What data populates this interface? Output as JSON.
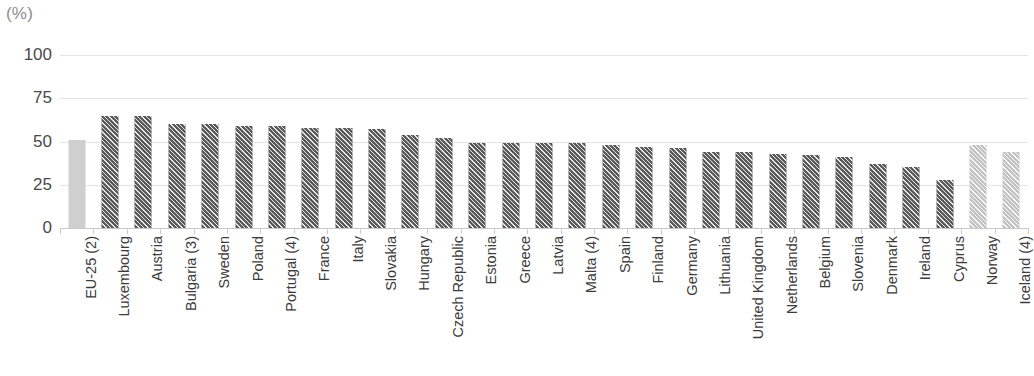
{
  "chart_data": {
    "type": "bar",
    "title": "",
    "subtitle": "",
    "unit_label": "(%)",
    "xlabel": "",
    "ylabel": "",
    "ylim": [
      0,
      100
    ],
    "yticks": [
      0,
      25,
      50,
      75,
      100
    ],
    "grid": true,
    "legend": "none",
    "orientation": "vertical",
    "categories": [
      "EU-25 (2)",
      "Luxembourg",
      "Austria",
      "Bulgaria (3)",
      "Sweden",
      "Poland",
      "Portugal (4)",
      "France",
      "Italy",
      "Slovakia",
      "Hungary",
      "Czech Republic",
      "Estonia",
      "Greece",
      "Latvia",
      "Malta (4)",
      "Spain",
      "Finland",
      "Germany",
      "Lithuania",
      "United Kingdom",
      "Netherlands",
      "Belgium",
      "Slovenia",
      "Denmark",
      "Ireland",
      "Cyprus",
      "Norway",
      "Iceland (4)"
    ],
    "values": [
      51,
      65,
      65,
      60,
      60,
      59,
      59,
      58,
      58,
      57,
      54,
      52,
      49,
      49,
      49,
      49,
      48,
      47,
      46,
      44,
      44,
      43,
      42,
      41,
      37,
      35,
      28,
      48,
      44
    ],
    "bar_styles": [
      "solid-light",
      "hatch-dark",
      "hatch-dark",
      "hatch-dark",
      "hatch-dark",
      "hatch-dark",
      "hatch-dark",
      "hatch-dark",
      "hatch-dark",
      "hatch-dark",
      "hatch-dark",
      "hatch-dark",
      "hatch-dark",
      "hatch-dark",
      "hatch-dark",
      "hatch-dark",
      "hatch-dark",
      "hatch-dark",
      "hatch-dark",
      "hatch-dark",
      "hatch-dark",
      "hatch-dark",
      "hatch-dark",
      "hatch-dark",
      "hatch-dark",
      "hatch-dark",
      "hatch-dark",
      "hatch-light",
      "hatch-light"
    ],
    "colors": {
      "aggregate_bar": "#cfcfcf",
      "member_bar": "#5a5a5a",
      "non_member_bar": "#c2c2c2",
      "gridline": "#e4e4e4",
      "axis": "#c9c9c9",
      "text": "#3c3c3c",
      "unit_text": "#8c8c8c"
    }
  }
}
